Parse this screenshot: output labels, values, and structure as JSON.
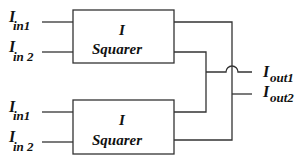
{
  "diagram": {
    "blocks": [
      {
        "id": "top",
        "title": "I",
        "subtitle": "Squarer",
        "inputs": [
          {
            "main": "I",
            "sub": "in1"
          },
          {
            "main": "I",
            "sub": "in 2"
          }
        ]
      },
      {
        "id": "bottom",
        "title": "I",
        "subtitle": "Squarer",
        "inputs": [
          {
            "main": "I",
            "sub": "in1"
          },
          {
            "main": "I",
            "sub": "in 2"
          }
        ]
      }
    ],
    "outputs": [
      {
        "main": "I",
        "sub": "out1"
      },
      {
        "main": "I",
        "sub": "out2"
      }
    ],
    "colors": {
      "line": "#333333",
      "text": "#111111",
      "background": "#ffffff"
    }
  }
}
